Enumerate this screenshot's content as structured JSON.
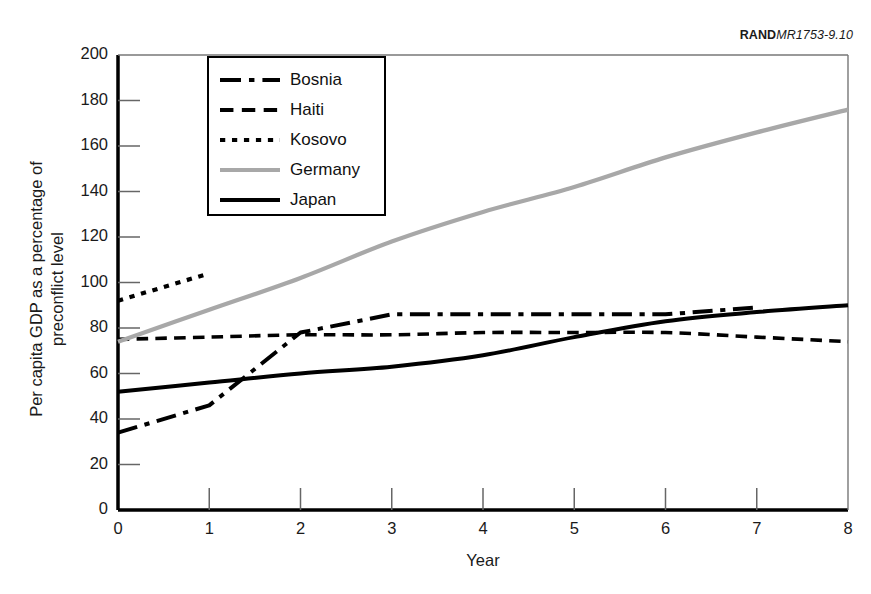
{
  "source_credit": {
    "brand": "RAND",
    "code": "MR1753-9.10"
  },
  "axes": {
    "y_title_line1": "Per capita GDP as a percentage of",
    "y_title_line2": "preconflict level",
    "x_title": "Year",
    "y_ticks": [
      "0",
      "20",
      "40",
      "60",
      "80",
      "100",
      "120",
      "140",
      "160",
      "180",
      "200"
    ],
    "x_ticks": [
      "0",
      "1",
      "2",
      "3",
      "4",
      "5",
      "6",
      "7",
      "8"
    ]
  },
  "legend": {
    "items": [
      {
        "label": "Bosnia",
        "style": "dash-dot",
        "color": "#000000"
      },
      {
        "label": "Haiti",
        "style": "dashed",
        "color": "#000000"
      },
      {
        "label": "Kosovo",
        "style": "dotted",
        "color": "#000000"
      },
      {
        "label": "Germany",
        "style": "solid",
        "color": "#a8a8a8"
      },
      {
        "label": "Japan",
        "style": "solid",
        "color": "#000000"
      }
    ]
  },
  "chart_data": {
    "type": "line",
    "title": "",
    "xlabel": "Year",
    "ylabel": "Per capita GDP as a percentage of preconflict level",
    "xlim": [
      0,
      8
    ],
    "ylim": [
      0,
      200
    ],
    "xticks": [
      0,
      1,
      2,
      3,
      4,
      5,
      6,
      7,
      8
    ],
    "yticks": [
      0,
      20,
      40,
      60,
      80,
      100,
      120,
      140,
      160,
      180,
      200
    ],
    "grid": false,
    "legend_position": "upper-left-inset",
    "series": [
      {
        "name": "Bosnia",
        "style": "dash-dot",
        "color": "#000000",
        "x": [
          0,
          1,
          2,
          3,
          4,
          5,
          6,
          7
        ],
        "values": [
          34,
          46,
          78,
          86,
          86,
          86,
          86,
          89
        ]
      },
      {
        "name": "Haiti",
        "style": "dashed",
        "color": "#000000",
        "x": [
          0,
          1,
          2,
          3,
          4,
          5,
          6,
          7,
          8
        ],
        "values": [
          75,
          76,
          77,
          77,
          78,
          78,
          78,
          76,
          74
        ]
      },
      {
        "name": "Kosovo",
        "style": "dotted",
        "color": "#000000",
        "x": [
          0,
          1
        ],
        "values": [
          92,
          104
        ]
      },
      {
        "name": "Germany",
        "style": "solid",
        "color": "#a8a8a8",
        "x": [
          0,
          1,
          2,
          3,
          4,
          5,
          6,
          7,
          8
        ],
        "values": [
          74,
          88,
          102,
          118,
          131,
          142,
          155,
          166,
          176
        ]
      },
      {
        "name": "Japan",
        "style": "solid",
        "color": "#000000",
        "x": [
          0,
          1,
          2,
          3,
          4,
          5,
          6,
          7,
          8
        ],
        "values": [
          52,
          56,
          60,
          63,
          68,
          76,
          83,
          87,
          90
        ]
      }
    ]
  }
}
